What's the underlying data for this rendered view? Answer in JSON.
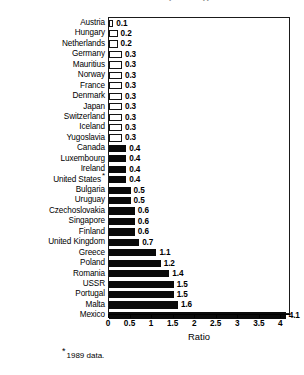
{
  "chart_data": {
    "type": "bar",
    "orientation": "horizontal",
    "title": "Number of Doctors by Size Typical",
    "xlabel": "Ratio",
    "ylabel": "",
    "xlim": [
      0,
      4.2
    ],
    "xticks": [
      "0",
      "0.5",
      "1",
      "1.5",
      "2",
      "2.5",
      "3",
      "3.5",
      "4"
    ],
    "xtick_values": [
      0,
      0.5,
      1,
      1.5,
      2,
      2.5,
      3,
      3.5,
      4
    ],
    "grid": false,
    "legend": null,
    "categories": [
      "Austria",
      "Hungary",
      "Netherlands",
      "Germany",
      "Mauritius",
      "Norway",
      "France",
      "Denmark",
      "Japan",
      "Switzerland",
      "Iceland",
      "Yugoslavia",
      "Canada",
      "Luxembourg",
      "Ireland",
      "United States",
      "Bulgaria",
      "Uruguay",
      "Czechoslovakia",
      "Singapore",
      "Finland",
      "United Kingdom",
      "Greece",
      "Poland",
      "Romania",
      "USSR",
      "Portugal",
      "Malta",
      "Mexico"
    ],
    "values": [
      0.1,
      0.2,
      0.2,
      0.3,
      0.3,
      0.3,
      0.3,
      0.3,
      0.3,
      0.3,
      0.3,
      0.3,
      0.4,
      0.4,
      0.4,
      0.4,
      0.5,
      0.5,
      0.6,
      0.6,
      0.6,
      0.7,
      1.1,
      1.2,
      1.4,
      1.5,
      1.5,
      1.6,
      4.1
    ],
    "value_labels": [
      "0.1",
      "0.2",
      "0.2",
      "0.3",
      "0.3",
      "0.3",
      "0.3",
      "0.3",
      "0.3",
      "0.3",
      "0.3",
      "0.3",
      "0.4",
      "0.4",
      "0.4",
      "0.4",
      "0.5",
      "0.5",
      "0.6",
      "0.6",
      "0.6",
      "0.7",
      "1.1",
      "1.2",
      "1.4",
      "1.5",
      "1.5",
      "1.6",
      "4.1"
    ],
    "footnote_markers": {
      "United States": "*"
    },
    "bar_styles": [
      "hollow",
      "hollow",
      "hollow",
      "hollow",
      "hollow",
      "hollow",
      "hollow",
      "hollow",
      "hollow",
      "hollow",
      "hollow",
      "hollow",
      "filled",
      "filled",
      "filled",
      "filled",
      "filled",
      "filled",
      "filled",
      "filled",
      "filled",
      "filled",
      "filled",
      "filled",
      "filled",
      "filled",
      "filled",
      "filled",
      "filled"
    ],
    "colors": {
      "bar_filled": "#0a0a0a",
      "bar_hollow_fill": "#ffffff",
      "bar_outline": "#141414",
      "axis": "#000000",
      "background": "#ffffff"
    }
  },
  "footnote": {
    "marker": "*",
    "text": "1989 data."
  }
}
